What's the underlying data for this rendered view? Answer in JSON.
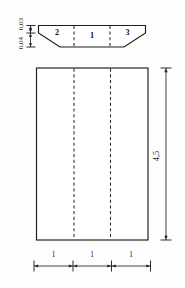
{
  "figure": {
    "kind": "engineering-drawing",
    "background_color": "#fdfdfd",
    "line_color": "#1d1d1d",
    "dash_color": "#2a2a2a"
  },
  "cross_section": {
    "name": "trapezoid-cross-section",
    "regions": [
      {
        "id": "region-2",
        "label": "2"
      },
      {
        "id": "region-1",
        "label": "1"
      },
      {
        "id": "region-3",
        "label": "3"
      }
    ],
    "divider_style": "dashed"
  },
  "plan_view": {
    "name": "rectangle-plan-view",
    "divider_count": 2,
    "divider_style": "dashed"
  },
  "dimensions": {
    "left_vertical": {
      "name": "thickness-dimensions",
      "orientation": "vertical-rotated",
      "upper_label": "0,03",
      "lower_label": "0,04"
    },
    "right_vertical": {
      "name": "length-dimension",
      "orientation": "vertical-rotated",
      "label": "4,5"
    },
    "bottom_horizontal": {
      "name": "width-dimension-chain",
      "orientation": "horizontal",
      "segments": [
        {
          "label": "1"
        },
        {
          "label": "1"
        },
        {
          "label": "1"
        }
      ]
    }
  }
}
